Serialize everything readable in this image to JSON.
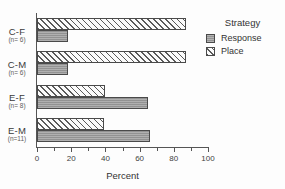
{
  "chart_data": {
    "type": "bar",
    "orientation": "horizontal",
    "title": "",
    "xlabel": "Percent",
    "ylabel": "",
    "xlim": [
      0,
      100
    ],
    "xticks": [
      0,
      20,
      40,
      60,
      80,
      100
    ],
    "xticklabels": [
      "0",
      "20",
      "40",
      "60",
      "80",
      "100"
    ],
    "grid": false,
    "legend": {
      "title": "Strategy",
      "position": "right",
      "entries": [
        "Response",
        "Place"
      ]
    },
    "categories": [
      "C-F",
      "C-M",
      "E-F",
      "E-M"
    ],
    "category_sublabels": [
      "(n= 6)",
      "(n= 6)",
      "(n= 8)",
      "(n=11)"
    ],
    "series": [
      {
        "name": "Response",
        "values": [
          18,
          18,
          65,
          66
        ]
      },
      {
        "name": "Place",
        "values": [
          87,
          87,
          40,
          39
        ]
      }
    ]
  },
  "axis": {
    "x_title": "Percent"
  },
  "legend": {
    "title": "Strategy",
    "items": [
      {
        "label": "Response",
        "swatch": "solid-gray"
      },
      {
        "label": "Place",
        "swatch": "hatched"
      }
    ]
  },
  "categories": [
    {
      "label": "C-F",
      "sublabel": "(n= 6)"
    },
    {
      "label": "C-M",
      "sublabel": "(n= 6)"
    },
    {
      "label": "E-F",
      "sublabel": "(n= 8)"
    },
    {
      "label": "E-M",
      "sublabel": "(n=11)"
    }
  ],
  "xticklabels": [
    "0",
    "20",
    "40",
    "60",
    "80",
    "100"
  ],
  "colors": {
    "response_fill": "#9a9a9a",
    "place_fill": "#fbfbfb",
    "hatch": "#5a5a5a",
    "bar_edge": "#4a4a4a",
    "axis": "#555555",
    "text": "#333333"
  }
}
